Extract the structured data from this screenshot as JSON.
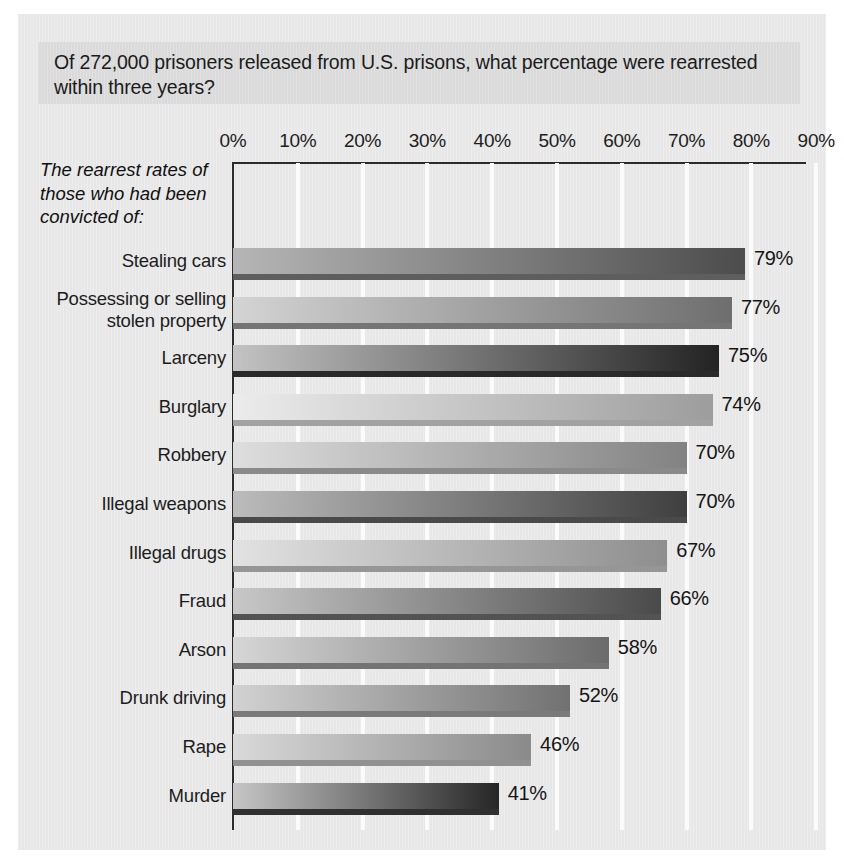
{
  "title": "Of 272,000 prisoners released from U.S. prisons, what percentage were rearrested within three years?",
  "y_axis_caption_lines": [
    "The rearrest rates of",
    "those who had been",
    "convicted of:"
  ],
  "chart_data": {
    "type": "bar",
    "orientation": "horizontal",
    "title": "Of 272,000 prisoners released from U.S. prisons, what percentage were rearrested within three years?",
    "xlabel": "",
    "ylabel": "The rearrest rates of those who had been convicted of:",
    "xlim": [
      0,
      90
    ],
    "xtick_labels": [
      "0%",
      "10%",
      "20%",
      "30%",
      "40%",
      "50%",
      "60%",
      "70%",
      "80%",
      "90%"
    ],
    "xticks": [
      0,
      10,
      20,
      30,
      40,
      50,
      60,
      70,
      80,
      90
    ],
    "grid": "vertical-white-gridlines",
    "legend": "none",
    "value_label_suffix": "%",
    "categories": [
      "Stealing cars",
      "Possessing or selling stolen property",
      "Larceny",
      "Burglary",
      "Robbery",
      "Illegal weapons",
      "Illegal drugs",
      "Fraud",
      "Arson",
      "Drunk driving",
      "Rape",
      "Murder"
    ],
    "values": [
      79,
      77,
      75,
      74,
      70,
      70,
      67,
      66,
      58,
      52,
      46,
      41
    ],
    "value_labels": [
      "79%",
      "77%",
      "75%",
      "74%",
      "70%",
      "70%",
      "67%",
      "66%",
      "58%",
      "52%",
      "46%",
      "41%"
    ]
  },
  "bars": [
    {
      "label_lines": [
        "Stealing cars"
      ],
      "value": 79,
      "value_label": "79%",
      "from": "#b6b6b6",
      "to": "#4c4c4c",
      "shadow": "#5e5e5e"
    },
    {
      "label_lines": [
        "Possessing or selling",
        "stolen property"
      ],
      "value": 77,
      "value_label": "77%",
      "from": "#d4d4d4",
      "to": "#6e6e6e",
      "shadow": "#757575"
    },
    {
      "label_lines": [
        "Larceny"
      ],
      "value": 75,
      "value_label": "75%",
      "from": "#c3c3c3",
      "to": "#232323",
      "shadow": "#2a2a2a"
    },
    {
      "label_lines": [
        "Burglary"
      ],
      "value": 74,
      "value_label": "74%",
      "from": "#ececec",
      "to": "#9d9d9d",
      "shadow": "#a2a2a2"
    },
    {
      "label_lines": [
        "Robbery"
      ],
      "value": 70,
      "value_label": "70%",
      "from": "#dedede",
      "to": "#828282",
      "shadow": "#8a8a8a"
    },
    {
      "label_lines": [
        "Illegal weapons"
      ],
      "value": 70,
      "value_label": "70%",
      "from": "#bcbcbc",
      "to": "#3f3f3f",
      "shadow": "#4a4a4a"
    },
    {
      "label_lines": [
        "Illegal drugs"
      ],
      "value": 67,
      "value_label": "67%",
      "from": "#e2e2e2",
      "to": "#8e8e8e",
      "shadow": "#969696"
    },
    {
      "label_lines": [
        "Fraud"
      ],
      "value": 66,
      "value_label": "66%",
      "from": "#c8c8c8",
      "to": "#4a4a4a",
      "shadow": "#535353"
    },
    {
      "label_lines": [
        "Arson"
      ],
      "value": 58,
      "value_label": "58%",
      "from": "#d6d6d6",
      "to": "#6b6b6b",
      "shadow": "#747474"
    },
    {
      "label_lines": [
        "Drunk driving"
      ],
      "value": 52,
      "value_label": "52%",
      "from": "#d2d2d2",
      "to": "#717171",
      "shadow": "#7a7a7a"
    },
    {
      "label_lines": [
        "Rape"
      ],
      "value": 46,
      "value_label": "46%",
      "from": "#d9d9d9",
      "to": "#8a8a8a",
      "shadow": "#919191"
    },
    {
      "label_lines": [
        "Murder"
      ],
      "value": 41,
      "value_label": "41%",
      "from": "#c6c6c6",
      "to": "#262626",
      "shadow": "#303030"
    }
  ],
  "colors": {
    "page": "#e9e9e9",
    "title_band": "#dcdcdc",
    "axis": "#2b2b2b",
    "gridline": "#fbfbfb",
    "text": "#1b1b1b"
  },
  "geometry": {
    "plot_left": 233,
    "plot_top": 163,
    "plot_width": 572,
    "plot_height": 667,
    "px_per_percent": 6.48,
    "row_pitch": 48.6,
    "first_bar_top": 248,
    "bar_height": 26
  }
}
